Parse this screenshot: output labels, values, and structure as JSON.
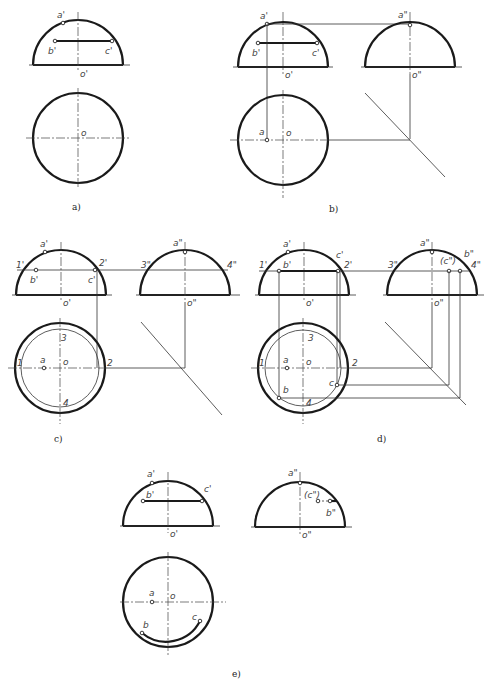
{
  "figure": {
    "panels": [
      {
        "id": "a",
        "caption": "a)",
        "labels": {
          "a_front": "a'",
          "b_front": "b'",
          "c_front": "c'",
          "o_front": "o'",
          "o_top": "o"
        }
      },
      {
        "id": "b",
        "caption": "b)",
        "labels": {
          "a_front": "a'",
          "b_front": "b'",
          "c_front": "c'",
          "o_front": "o'",
          "a_side": "a\"",
          "o_side": "o\"",
          "a_top": "a",
          "o_top": "o"
        }
      },
      {
        "id": "c",
        "caption": "c)",
        "labels": {
          "a_front": "a'",
          "b_front": "b'",
          "c_front": "c'",
          "p1_front": "1'",
          "p2_front": "2'",
          "o_front": "o'",
          "a_side": "a\"",
          "p3_side": "3\"",
          "p4_side": "4\"",
          "o_side": "o\"",
          "a_top": "a",
          "o_top": "o",
          "p1_top": "1",
          "p2_top": "2",
          "p3_top": "3",
          "p4_top": "4"
        }
      },
      {
        "id": "d",
        "caption": "d)",
        "labels": {
          "a_front": "a'",
          "b_front": "b'",
          "c_front": "c'",
          "p1_front": "1'",
          "p2_front": "2'",
          "o_front": "o'",
          "a_side": "a\"",
          "c_side": "(c\")",
          "b_side": "b\"",
          "p3_side": "3\"",
          "p4_side": "4\"",
          "o_side": "o\"",
          "a_top": "a",
          "b_top": "b",
          "c_top": "c",
          "o_top": "o",
          "p1_top": "1",
          "p2_top": "2",
          "p3_top": "3",
          "p4_top": "4"
        }
      },
      {
        "id": "e",
        "caption": "e)",
        "labels": {
          "a_front": "a'",
          "b_front": "b'",
          "c_front": "c'",
          "o_front": "o'",
          "a_side": "a\"",
          "c_side": "(c\")",
          "b_side": "b\"",
          "o_side": "o\"",
          "a_top": "a",
          "b_top": "b",
          "c_top": "c",
          "o_top": "o"
        }
      }
    ]
  }
}
